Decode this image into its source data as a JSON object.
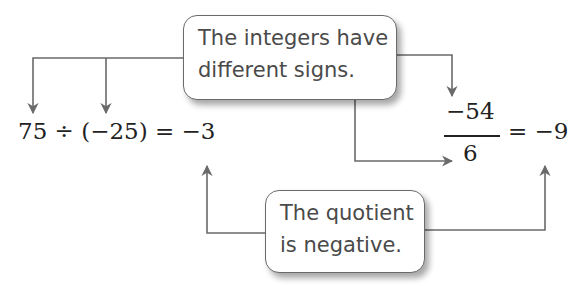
{
  "diagram": {
    "top_callout": {
      "lines": [
        "The integers have",
        "different signs."
      ]
    },
    "bottom_callout": {
      "lines": [
        "The quotient",
        "is negative."
      ]
    },
    "equation_left": {
      "text": "75 ÷ (−25) = −3",
      "dividend": "75",
      "divisor": "−25",
      "quotient": "−3"
    },
    "equation_right": {
      "numerator": "−54",
      "denominator": "6",
      "result": "= −9"
    },
    "colors": {
      "arrow": "#6a6a6a",
      "text": "#4a4a4a",
      "math": "#222222"
    }
  }
}
